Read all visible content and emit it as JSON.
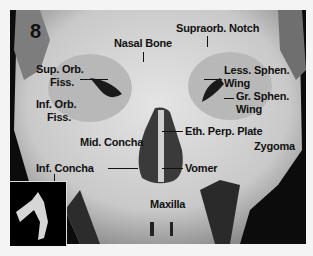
{
  "figure": {
    "number": "8",
    "labels": {
      "nasal_bone": "Nasal Bone",
      "supraorb_notch": "Supraorb. Notch",
      "sup_orb_fiss_1": "Sup. Orb.",
      "sup_orb_fiss_2": "Fiss.",
      "inf_orb_fiss_1": "Inf. Orb.",
      "inf_orb_fiss_2": "Fiss.",
      "less_sphen_1": "Less. Sphen.",
      "less_sphen_2": "Wing",
      "gr_sphen_1": "Gr. Sphen.",
      "gr_sphen_2": "Wing",
      "mid_concha": "Mid. Concha",
      "eth_perp_plate": "Eth. Perp. Plate",
      "zygoma": "Zygoma",
      "inf_concha": "Inf. Concha",
      "vomer": "Vomer",
      "maxilla": "Maxilla"
    }
  }
}
